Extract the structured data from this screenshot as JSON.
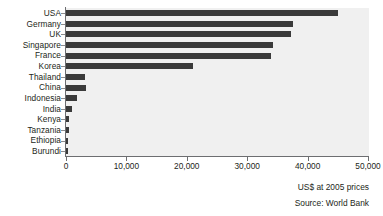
{
  "chart_data": {
    "type": "bar",
    "orientation": "horizontal",
    "title": "",
    "xlabel": "US$ at 2005 prices",
    "ylabel": "",
    "xlim": [
      0,
      50000
    ],
    "xticks": [
      0,
      10000,
      20000,
      30000,
      40000,
      50000
    ],
    "xtick_labels": [
      "0",
      "10,000",
      "20,000",
      "30,000",
      "40,000",
      "50,000"
    ],
    "grid": false,
    "legend": null,
    "categories": [
      "USA",
      "Germany",
      "UK",
      "Singapore",
      "France",
      "Korea",
      "Thailand",
      "China",
      "Indonesia",
      "India",
      "Kenya",
      "Tanzania",
      "Ethiopia",
      "Burundi"
    ],
    "values": [
      45000,
      37500,
      37300,
      34300,
      34000,
      21000,
      3200,
      3300,
      1800,
      1000,
      550,
      450,
      300,
      280
    ],
    "annotations": [
      "Source: World Bank"
    ],
    "bar_color": "#3a3a3a",
    "plot_background": "#f0f0f0",
    "axis_color": "#6d6e71"
  },
  "captions": {
    "axis_caption": "US$ at 2005 prices",
    "source": "Source: World Bank"
  }
}
